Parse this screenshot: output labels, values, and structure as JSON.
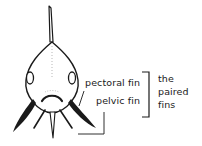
{
  "diagram": {
    "labels": {
      "pectoral": "pectoral fin",
      "pelvic": "pelvic fin",
      "group_line1": "the",
      "group_line2": "paired",
      "group_line3": "fins"
    },
    "colors": {
      "ink": "#1a1a1a",
      "background": "#ffffff"
    }
  }
}
